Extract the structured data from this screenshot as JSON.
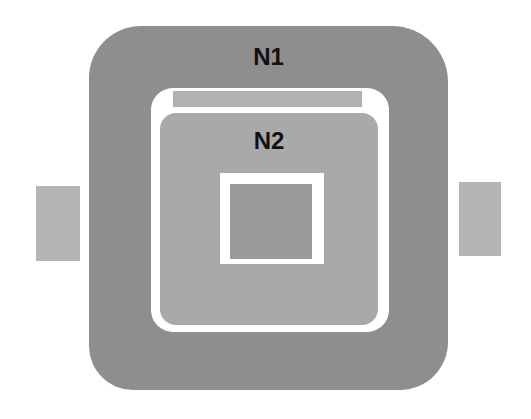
{
  "diagram": {
    "outer_region": {
      "label": "N1",
      "color": "#8e8e8e"
    },
    "inner_region": {
      "label": "N2",
      "color": "#a9a9a9"
    },
    "top_bar": {
      "color": "#b1b1b1"
    },
    "core": {
      "color": "#9b9b9b"
    },
    "side_tabs": [
      {
        "position": "left",
        "color": "#b5b5b5"
      },
      {
        "position": "right",
        "color": "#b5b5b5"
      }
    ],
    "separator_color": "#ffffff"
  }
}
